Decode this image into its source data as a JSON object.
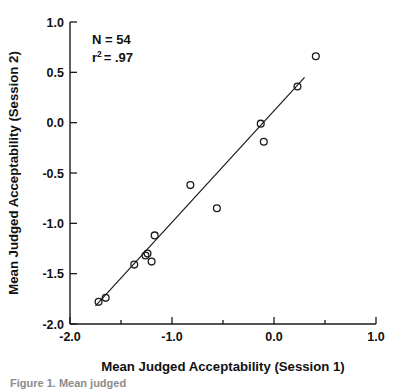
{
  "chart_data": {
    "type": "scatter",
    "title": "",
    "xlabel": "Mean Judged Acceptability (Session 1)",
    "ylabel": "Mean Judged Acceptability (Session 2)",
    "xlim": [
      -2.0,
      1.0
    ],
    "ylim": [
      -2.0,
      1.0
    ],
    "xticks": [
      -2.0,
      -1.0,
      0.0,
      1.0
    ],
    "xtick_labels": [
      "-2.0",
      "-1.0",
      "0.0",
      "1.0"
    ],
    "yticks": [
      -2.0,
      -1.5,
      -1.0,
      -0.5,
      0.0,
      0.5,
      1.0
    ],
    "ytick_labels": [
      "-2.0",
      "-1.5",
      "-1.0",
      "-0.5",
      "0.0",
      "0.5",
      "1.0"
    ],
    "x_minor_ticks": [
      -1.5,
      -0.5,
      0.5
    ],
    "grid": false,
    "legend": false,
    "marker": "open-circle",
    "points": [
      {
        "x": -1.72,
        "y": -1.78
      },
      {
        "x": -1.65,
        "y": -1.74
      },
      {
        "x": -1.37,
        "y": -1.41
      },
      {
        "x": -1.26,
        "y": -1.32
      },
      {
        "x": -1.24,
        "y": -1.3
      },
      {
        "x": -1.2,
        "y": -1.38
      },
      {
        "x": -1.17,
        "y": -1.12
      },
      {
        "x": -0.82,
        "y": -0.62
      },
      {
        "x": -0.56,
        "y": -0.85
      },
      {
        "x": -0.13,
        "y": -0.01
      },
      {
        "x": -0.1,
        "y": -0.19
      },
      {
        "x": 0.23,
        "y": 0.36
      },
      {
        "x": 0.41,
        "y": 0.66
      }
    ],
    "fit_line": {
      "type": "linear-regression",
      "x_start": -1.75,
      "y_start": -1.82,
      "x_end": 0.3,
      "y_end": 0.45
    },
    "annotations": {
      "n_label": "N = 54",
      "r2_base": "r",
      "r2_exponent": "2",
      "r2_value": "= .97"
    }
  },
  "caption": {
    "partial_text": "Figure 1. Mean judged"
  },
  "colors": {
    "axis": "#1a1a1a",
    "marker_stroke": "#1a1a1a",
    "fit_line": "#1a1a1a",
    "background": "#ffffff",
    "caption": "#8c8c8c"
  }
}
